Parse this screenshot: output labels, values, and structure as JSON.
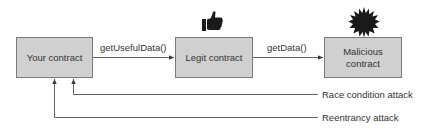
{
  "diagram": {
    "nodes": [
      {
        "id": "your",
        "label": "Your contract",
        "icon": null
      },
      {
        "id": "legit",
        "label": "Legit contract",
        "icon": "thumbs-up-icon"
      },
      {
        "id": "malicious",
        "label": "Malicious contract",
        "icon": "starburst-icon"
      }
    ],
    "edges": [
      {
        "from": "your",
        "to": "legit",
        "label": "getUsefulData()"
      },
      {
        "from": "legit",
        "to": "malicious",
        "label": "getData()"
      },
      {
        "from": "malicious",
        "to": "your",
        "label": "Race condition attack"
      },
      {
        "from": "malicious",
        "to": "your",
        "label": "Reentrancy attack"
      }
    ],
    "colors": {
      "box_fill": "#d0d0d0",
      "box_border": "#7a7a7a",
      "line": "#3a3a3a",
      "icon": "#1a1a1a"
    }
  }
}
